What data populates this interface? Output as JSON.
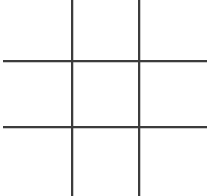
{
  "board": {
    "title": "Tic-Tac-Toe Grid",
    "width": 212,
    "height": 196,
    "background_color": "#ffffff",
    "line_color": "#3c3c3c",
    "line_thickness": 1.6,
    "rows": 3,
    "columns": 3,
    "lines": [
      {
        "name": "vertical-line-left",
        "orientation": "vertical",
        "position": 71,
        "start": 0,
        "end": 196
      },
      {
        "name": "vertical-line-right",
        "orientation": "vertical",
        "position": 138,
        "start": 0,
        "end": 196
      },
      {
        "name": "horizontal-line-top",
        "orientation": "horizontal",
        "position": 60,
        "start": 3,
        "end": 207
      },
      {
        "name": "horizontal-line-bottom",
        "orientation": "horizontal",
        "position": 126,
        "start": 3,
        "end": 207
      }
    ],
    "cells": [
      {
        "id": "cell-r1c1",
        "row": 1,
        "column": 1,
        "mark": ""
      },
      {
        "id": "cell-r1c2",
        "row": 1,
        "column": 2,
        "mark": ""
      },
      {
        "id": "cell-r1c3",
        "row": 1,
        "column": 3,
        "mark": ""
      },
      {
        "id": "cell-r2c1",
        "row": 2,
        "column": 1,
        "mark": ""
      },
      {
        "id": "cell-r2c2",
        "row": 2,
        "column": 2,
        "mark": ""
      },
      {
        "id": "cell-r2c3",
        "row": 2,
        "column": 3,
        "mark": ""
      },
      {
        "id": "cell-r3c1",
        "row": 3,
        "column": 1,
        "mark": ""
      },
      {
        "id": "cell-r3c2",
        "row": 3,
        "column": 2,
        "mark": ""
      },
      {
        "id": "cell-r3c3",
        "row": 3,
        "column": 3,
        "mark": ""
      }
    ]
  }
}
